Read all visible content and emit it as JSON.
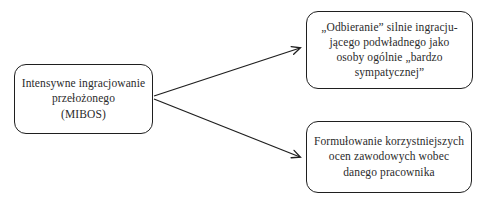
{
  "diagram": {
    "background_color": "#ffffff",
    "line_color": "#1f1f1f",
    "node_border_color": "#1f1f1f",
    "text_color": "#2b2b2b",
    "nodes": {
      "mibos": {
        "role": "antecedent",
        "lines": [
          "Intensywne ingracjowanie",
          "przełożonego",
          "(MIBOS)"
        ]
      },
      "perception": {
        "role": "outcome-top",
        "lines": [
          "„Odbieranie” silnie ingracju-",
          "jącego podwładnego jako",
          "osoby ogólnie „bardzo",
          "sympatycznej”"
        ]
      },
      "evaluations": {
        "role": "outcome-bottom",
        "lines": [
          "Formułowanie korzystniejszych",
          "ocen zawodowych wobec",
          "danego pracownika"
        ]
      }
    },
    "edges": [
      {
        "from": "mibos",
        "to": "perception",
        "style": "arrow"
      },
      {
        "from": "mibos",
        "to": "evaluations",
        "style": "arrow"
      }
    ]
  }
}
